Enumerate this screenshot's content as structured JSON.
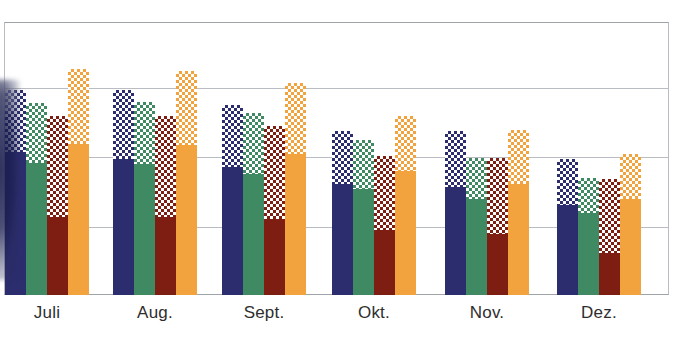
{
  "chart_data": {
    "type": "bar",
    "title": "",
    "subtitle": "",
    "xlabel": "",
    "ylabel": "",
    "grid": true,
    "legend_position": "none",
    "categories": [
      "Juli",
      "Aug.",
      "Sept.",
      "Okt.",
      "Nov.",
      "Dez."
    ],
    "ylim": [
      0,
      4
    ],
    "y_gridline_values": [
      0,
      1,
      2,
      3,
      4
    ],
    "bar_group_note": "Each bar is drawn with a solid lower segment and a checkered upper segment of the same hue.",
    "series": [
      {
        "name": "Serie 1",
        "color": "#2b2d6e",
        "pattern": "solid-with-checker-top",
        "values": [
          3.0,
          3.0,
          2.78,
          2.41,
          2.41,
          1.99
        ],
        "solid_values": [
          2.09,
          2.0,
          1.87,
          1.63,
          1.58,
          1.32
        ]
      },
      {
        "name": "Serie 2",
        "color": "#3f8a63",
        "pattern": "solid-with-checker-top",
        "values": [
          2.82,
          2.83,
          2.66,
          2.27,
          2.01,
          1.72
        ],
        "solid_values": [
          1.93,
          1.92,
          1.78,
          1.56,
          1.4,
          1.2
        ]
      },
      {
        "name": "Serie 3",
        "color": "#7e1d12",
        "pattern": "solid-with-checker-top",
        "values": [
          2.62,
          2.62,
          2.48,
          2.04,
          2.01,
          1.7
        ],
        "solid_values": [
          1.14,
          1.15,
          1.12,
          0.95,
          0.9,
          0.62
        ]
      },
      {
        "name": "Serie 4",
        "color": "#f2a33e",
        "pattern": "solid-with-checker-top",
        "values": [
          3.31,
          3.28,
          3.1,
          2.62,
          2.42,
          2.06
        ],
        "solid_values": [
          2.21,
          2.2,
          2.07,
          1.81,
          1.63,
          1.4
        ]
      }
    ]
  },
  "axis": {
    "labels": [
      "Juli",
      "Aug.",
      "Sept.",
      "Okt.",
      "Nov.",
      "Dez."
    ]
  },
  "palette": {
    "navy": "#2b2d6e",
    "green": "#3f8a63",
    "darkred": "#7e1d12",
    "orange": "#f2a33e",
    "gridline": "#b9bcc2",
    "frame": "#9fa3aa",
    "label_text": "#2e2e2e",
    "background": "#ffffff"
  }
}
